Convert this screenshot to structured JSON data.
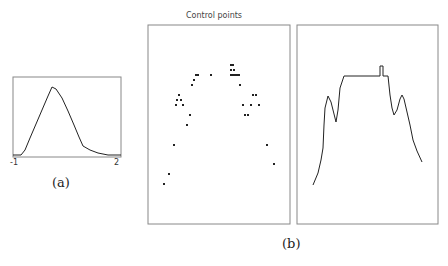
{
  "figure_a": {
    "caption": "(a)",
    "x_tick_left": "-1",
    "x_tick_right": "2",
    "curve": [
      [
        13,
        155
      ],
      [
        21,
        155
      ],
      [
        25,
        150
      ],
      [
        30,
        138
      ],
      [
        36,
        124
      ],
      [
        42,
        110
      ],
      [
        48,
        96
      ],
      [
        52,
        87
      ],
      [
        56,
        89
      ],
      [
        62,
        98
      ],
      [
        68,
        111
      ],
      [
        74,
        125
      ],
      [
        79,
        137
      ],
      [
        83,
        146
      ],
      [
        90,
        150
      ],
      [
        98,
        153
      ],
      [
        108,
        155
      ],
      [
        121,
        155
      ]
    ]
  },
  "figure_b": {
    "caption": "(b)",
    "left_panel_title": "Control points",
    "control_points": [
      [
        196,
        75
      ],
      [
        198,
        75
      ],
      [
        194,
        80
      ],
      [
        192,
        85
      ],
      [
        179,
        95
      ],
      [
        177,
        100
      ],
      [
        181,
        100
      ],
      [
        176,
        105
      ],
      [
        183,
        105
      ],
      [
        190,
        115
      ],
      [
        187,
        125
      ],
      [
        211,
        75
      ],
      [
        231,
        65
      ],
      [
        232,
        65
      ],
      [
        233,
        65
      ],
      [
        231,
        70
      ],
      [
        234,
        70
      ],
      [
        231,
        75
      ],
      [
        233,
        75
      ],
      [
        235,
        75
      ],
      [
        237,
        75
      ],
      [
        239,
        75
      ],
      [
        240,
        85
      ],
      [
        253,
        95
      ],
      [
        256,
        95
      ],
      [
        243,
        105
      ],
      [
        251,
        105
      ],
      [
        259,
        105
      ],
      [
        245,
        115
      ],
      [
        248,
        115
      ],
      [
        174,
        145
      ],
      [
        169,
        174
      ],
      [
        164,
        184
      ],
      [
        267,
        145
      ],
      [
        274,
        164
      ]
    ],
    "right_curve": [
      [
        313,
        185
      ],
      [
        318,
        173
      ],
      [
        321,
        160
      ],
      [
        323,
        148
      ],
      [
        324,
        125
      ],
      [
        325,
        108
      ],
      [
        328,
        96
      ],
      [
        331,
        102
      ],
      [
        334,
        114
      ],
      [
        336,
        122
      ],
      [
        338,
        110
      ],
      [
        340,
        88
      ],
      [
        344,
        76
      ],
      [
        380,
        76
      ],
      [
        380,
        66
      ],
      [
        383,
        66
      ],
      [
        383,
        76
      ],
      [
        388,
        76
      ],
      [
        390,
        95
      ],
      [
        392,
        108
      ],
      [
        394,
        115
      ],
      [
        397,
        110
      ],
      [
        400,
        99
      ],
      [
        402,
        95
      ],
      [
        404,
        99
      ],
      [
        407,
        112
      ],
      [
        410,
        125
      ],
      [
        413,
        140
      ],
      [
        417,
        151
      ],
      [
        422,
        162
      ]
    ]
  }
}
